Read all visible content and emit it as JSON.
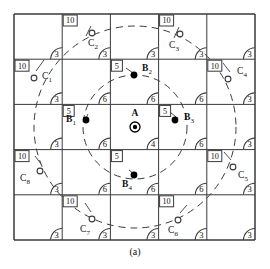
{
  "figure": {
    "caption": "(a)",
    "grid": {
      "rows": 5,
      "cols": 5,
      "x0": 14,
      "y0": 14,
      "cell_w": 48.2,
      "cell_h": 45.2
    },
    "colors": {
      "line": "#3a3a3a",
      "dash": "#3a3a3a",
      "text": "#111111",
      "fill": "#000000",
      "bg": "#ffffff"
    }
  },
  "chart_data": {
    "type": "diagram",
    "title": "",
    "subtitle": "",
    "xlabel": "",
    "ylabel": "",
    "grid": true,
    "legend": "none",
    "cells": [
      {
        "row": 0,
        "col": 0,
        "corner_value": "3",
        "box_value": null
      },
      {
        "row": 0,
        "col": 1,
        "corner_value": "3",
        "box_value": "10"
      },
      {
        "row": 0,
        "col": 2,
        "corner_value": "3",
        "box_value": null
      },
      {
        "row": 0,
        "col": 3,
        "corner_value": "3",
        "box_value": "10"
      },
      {
        "row": 0,
        "col": 4,
        "corner_value": "3",
        "box_value": null
      },
      {
        "row": 1,
        "col": 0,
        "corner_value": "3",
        "box_value": "10"
      },
      {
        "row": 1,
        "col": 1,
        "corner_value": "6",
        "box_value": null
      },
      {
        "row": 1,
        "col": 2,
        "corner_value": "6",
        "box_value": "5"
      },
      {
        "row": 1,
        "col": 3,
        "corner_value": "6",
        "box_value": null
      },
      {
        "row": 1,
        "col": 4,
        "corner_value": "3",
        "box_value": "10"
      },
      {
        "row": 2,
        "col": 0,
        "corner_value": "3",
        "box_value": null
      },
      {
        "row": 2,
        "col": 1,
        "corner_value": "6",
        "box_value": "5"
      },
      {
        "row": 2,
        "col": 2,
        "corner_value": "4",
        "box_value": null
      },
      {
        "row": 2,
        "col": 3,
        "corner_value": "6",
        "box_value": "5"
      },
      {
        "row": 2,
        "col": 4,
        "corner_value": "3",
        "box_value": null
      },
      {
        "row": 3,
        "col": 0,
        "corner_value": "3",
        "box_value": "10"
      },
      {
        "row": 3,
        "col": 1,
        "corner_value": "6",
        "box_value": null
      },
      {
        "row": 3,
        "col": 2,
        "corner_value": "6",
        "box_value": "5"
      },
      {
        "row": 3,
        "col": 3,
        "corner_value": "6",
        "box_value": null
      },
      {
        "row": 3,
        "col": 4,
        "corner_value": "3",
        "box_value": "10"
      },
      {
        "row": 4,
        "col": 0,
        "corner_value": "3",
        "box_value": null
      },
      {
        "row": 4,
        "col": 1,
        "corner_value": "3",
        "box_value": "10"
      },
      {
        "row": 4,
        "col": 2,
        "corner_value": "3",
        "box_value": null
      },
      {
        "row": 4,
        "col": 3,
        "corner_value": "3",
        "box_value": "10"
      },
      {
        "row": 4,
        "col": 4,
        "corner_value": "3",
        "box_value": null
      }
    ],
    "nodes": [
      {
        "id": "A",
        "label": "A",
        "sub": "",
        "x": 135,
        "y": 127,
        "marker": "target",
        "label_dx": 0,
        "label_dy": -11
      },
      {
        "id": "B1",
        "label": "B",
        "sub": "1",
        "x": 86,
        "y": 120,
        "marker": "filled",
        "label_dx": -15,
        "label_dy": 2
      },
      {
        "id": "B2",
        "label": "B",
        "sub": "2",
        "x": 134,
        "y": 75,
        "marker": "filled",
        "label_dx": 13,
        "label_dy": -4
      },
      {
        "id": "B3",
        "label": "B",
        "sub": "3",
        "x": 175,
        "y": 120,
        "marker": "filled",
        "label_dx": 14,
        "label_dy": 0
      },
      {
        "id": "B4",
        "label": "B",
        "sub": "4",
        "x": 134,
        "y": 175,
        "marker": "filled",
        "label_dx": -7,
        "label_dy": 12
      },
      {
        "id": "C1",
        "label": "C",
        "sub": "1",
        "x": 34,
        "y": 78,
        "marker": "open",
        "label_dx": 13,
        "label_dy": 1
      },
      {
        "id": "C2",
        "label": "C",
        "sub": "2",
        "x": 92,
        "y": 33,
        "marker": "open",
        "label_dx": 1,
        "label_dy": 13
      },
      {
        "id": "C3",
        "label": "C",
        "sub": "3",
        "x": 180,
        "y": 34,
        "marker": "open",
        "label_dx": -6,
        "label_dy": 14
      },
      {
        "id": "C4",
        "label": "C",
        "sub": "4",
        "x": 228,
        "y": 79,
        "marker": "open",
        "label_dx": 14,
        "label_dy": -5
      },
      {
        "id": "C5",
        "label": "C",
        "sub": "5",
        "x": 233,
        "y": 167,
        "marker": "open",
        "label_dx": 10,
        "label_dy": 11
      },
      {
        "id": "C6",
        "label": "C",
        "sub": "6",
        "x": 178,
        "y": 220,
        "marker": "open",
        "label_dx": -5,
        "label_dy": 13
      },
      {
        "id": "C7",
        "label": "C",
        "sub": "7",
        "x": 92,
        "y": 219,
        "marker": "open",
        "label_dx": -7,
        "label_dy": 13
      },
      {
        "id": "C8",
        "label": "C",
        "sub": "8",
        "x": 40,
        "y": 171,
        "marker": "open",
        "label_dx": -15,
        "label_dy": 10
      }
    ],
    "rings": [
      {
        "name": "inner-ring",
        "cx": 135,
        "cy": 127,
        "r": 52
      },
      {
        "name": "outer-ring",
        "cx": 135,
        "cy": 127,
        "r": 101
      }
    ]
  }
}
